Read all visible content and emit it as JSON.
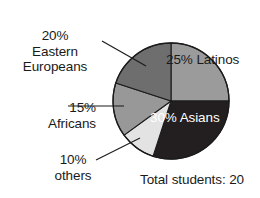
{
  "chart_data": {
    "type": "pie",
    "title": "",
    "caption": "Total students: 20",
    "total_students": 20,
    "legend_position": "none",
    "categories": [
      "Latinos",
      "Asians",
      "others",
      "Africans",
      "Eastern Europeans"
    ],
    "values": [
      25,
      30,
      10,
      15,
      20
    ],
    "value_unit": "percent",
    "slices": [
      {
        "name": "Latinos",
        "percent": 25,
        "percent_label": "25%",
        "label_placement": "inside",
        "color": "#9b9b9b",
        "text_color": "#1b1b1b",
        "start_angle_deg": 0,
        "end_angle_deg": 90
      },
      {
        "name": "Asians",
        "percent": 30,
        "percent_label": "30%",
        "label_placement": "inside",
        "color": "#231f20",
        "text_color": "#ffffff",
        "start_angle_deg": 90,
        "end_angle_deg": 198
      },
      {
        "name": "others",
        "percent": 10,
        "percent_label": "10%",
        "label_placement": "outside-leader",
        "color": "#e3e3e3",
        "text_color": "#1a1a1a",
        "start_angle_deg": 198,
        "end_angle_deg": 234
      },
      {
        "name": "Africans",
        "percent": 15,
        "percent_label": "15%",
        "label_placement": "outside-leader",
        "color": "#989898",
        "text_color": "#1a1a1a",
        "start_angle_deg": 234,
        "end_angle_deg": 288
      },
      {
        "name": "Eastern Europeans",
        "percent": 20,
        "percent_label": "20%",
        "label_placement": "outside-leader",
        "color": "#6e6e6e",
        "text_color": "#1a1a1a",
        "start_angle_deg": 288,
        "end_angle_deg": 360
      }
    ]
  },
  "labels": {
    "eastern_europeans": {
      "percent": "20%",
      "name_line1": "Eastern",
      "name_line2": "Europeans"
    },
    "africans": {
      "percent": "15%",
      "name": "Africans"
    },
    "others": {
      "percent": "10%",
      "name": "others"
    },
    "latinos": {
      "percent": "25%",
      "name": "Latinos"
    },
    "asians": {
      "percent": "30%",
      "name": "Asians"
    }
  },
  "caption": {
    "text": "Total students: 20"
  },
  "colors": {
    "latinos": "#9b9b9b",
    "asians": "#231f20",
    "others": "#e3e3e3",
    "africans": "#989898",
    "eastern_europeans": "#6e6e6e",
    "outline": "#1b1b1b",
    "background": "#ffffff",
    "text": "#1a1a1a"
  }
}
